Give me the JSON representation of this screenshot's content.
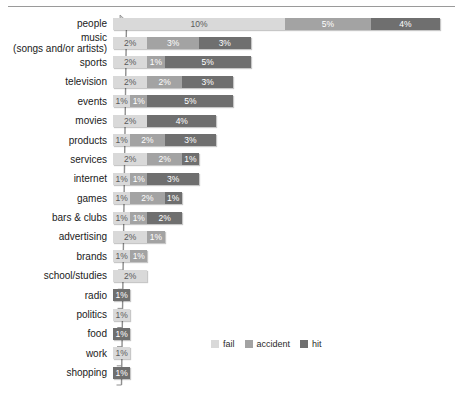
{
  "chart_data": {
    "type": "bar",
    "orientation": "horizontal",
    "stacked": true,
    "title": "",
    "subtitle": "",
    "xlabel": "",
    "ylabel": "",
    "grid": false,
    "xlim": [
      0,
      19
    ],
    "legend_position": "bottom-right",
    "categories": [
      "people",
      "music\n(songs and/or artists)",
      "sports",
      "television",
      "events",
      "movies",
      "products",
      "services",
      "internet",
      "games",
      "bars & clubs",
      "advertising",
      "brands",
      "school/studies",
      "radio",
      "politics",
      "food",
      "work",
      "shopping"
    ],
    "series": [
      {
        "name": "fail",
        "color": "#d9d9d9",
        "values": [
          10,
          2,
          2,
          2,
          1,
          2,
          1,
          2,
          1,
          1,
          1,
          2,
          1,
          2,
          0,
          1,
          0,
          1,
          0
        ]
      },
      {
        "name": "accident",
        "color": "#a3a3a3",
        "values": [
          5,
          3,
          1,
          2,
          1,
          0,
          2,
          2,
          1,
          2,
          1,
          1,
          1,
          0,
          0,
          0,
          0,
          0,
          0
        ]
      },
      {
        "name": "hit",
        "color": "#6f6f6f",
        "values": [
          4,
          3,
          5,
          3,
          5,
          4,
          3,
          1,
          3,
          1,
          2,
          0,
          0,
          0,
          1,
          0,
          1,
          0,
          1
        ]
      }
    ],
    "bar_labels": [
      [
        "10%",
        "5%",
        "4%"
      ],
      [
        "2%",
        "3%",
        "3%"
      ],
      [
        "2%",
        "1%",
        "5%"
      ],
      [
        "2%",
        "2%",
        "3%"
      ],
      [
        "1%",
        "1%",
        "5%"
      ],
      [
        "2%",
        "",
        "4%"
      ],
      [
        "1%",
        "2%",
        "3%"
      ],
      [
        "2%",
        "2%",
        "1%"
      ],
      [
        "1%",
        "1%",
        "3%"
      ],
      [
        "1%",
        "2%",
        "1%"
      ],
      [
        "1%",
        "1%",
        "2%"
      ],
      [
        "2%",
        "1%",
        ""
      ],
      [
        "1%",
        "1%",
        ""
      ],
      [
        "2%",
        "",
        ""
      ],
      [
        "",
        "",
        "1%"
      ],
      [
        "1%",
        "",
        ""
      ],
      [
        "",
        "",
        "1%"
      ],
      [
        "1%",
        "",
        ""
      ],
      [
        "",
        "",
        "1%"
      ]
    ]
  },
  "legend": {
    "items": [
      {
        "label": "fail"
      },
      {
        "label": "accident"
      },
      {
        "label": "hit"
      }
    ]
  }
}
